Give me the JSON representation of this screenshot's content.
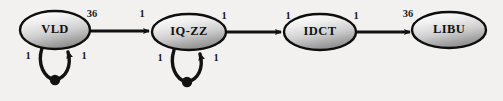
{
  "diagram": {
    "type": "directed-graph",
    "background_color": "#f2f1ef",
    "node_fill_light": "#fdfdfd",
    "node_fill_dark": "#8f8f8f",
    "stroke_color": "#111111",
    "nodes": [
      {
        "id": "vld",
        "label": "VLD",
        "cx": 55,
        "cy": 30,
        "rx": 35,
        "ry": 19
      },
      {
        "id": "iqzz",
        "label": "IQ-ZZ",
        "cx": 189,
        "cy": 32,
        "rx": 37,
        "ry": 18
      },
      {
        "id": "idct",
        "label": "IDCT",
        "cx": 320,
        "cy": 32,
        "rx": 36,
        "ry": 18
      },
      {
        "id": "libu",
        "label": "LIBU",
        "cx": 449,
        "cy": 30,
        "rx": 37,
        "ry": 18
      }
    ],
    "edges": [
      {
        "id": "vld-to-iqzz",
        "from": "VLD",
        "to": "IQ-ZZ",
        "tail_weight": "36",
        "head_weight": "1"
      },
      {
        "id": "iqzz-to-idct",
        "from": "IQ-ZZ",
        "to": "IDCT",
        "tail_weight": "1",
        "head_weight": "1"
      },
      {
        "id": "idct-to-libu",
        "from": "IDCT",
        "to": "LIBU",
        "tail_weight": "1",
        "head_weight": "36"
      }
    ],
    "self_loops": [
      {
        "id": "vld-self-loop",
        "node": "VLD",
        "left_weight": "1",
        "right_weight": "1"
      },
      {
        "id": "iqzz-self-loop",
        "node": "IQ-ZZ",
        "left_weight": "1",
        "right_weight": "1"
      }
    ],
    "labels": {
      "vld_out": "36",
      "iqzz_in": "1",
      "vld_loop_left": "1",
      "vld_loop_right": "1",
      "iqzz_out": "1",
      "idct_in": "1",
      "iqzz_loop_left": "1",
      "iqzz_loop_right": "1",
      "idct_out": "1",
      "libu_in": "36"
    }
  }
}
